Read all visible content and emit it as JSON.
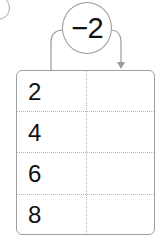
{
  "question_marker": "",
  "operation": {
    "label": "−2",
    "arrow_direction": "left-column-to-right-column"
  },
  "table": {
    "rows": [
      {
        "input": "2",
        "output": ""
      },
      {
        "input": "4",
        "output": ""
      },
      {
        "input": "6",
        "output": ""
      },
      {
        "input": "8",
        "output": ""
      }
    ]
  },
  "colors": {
    "stroke": "#9a9a9a",
    "text": "#111111",
    "dotted": "#b5b5b5"
  }
}
